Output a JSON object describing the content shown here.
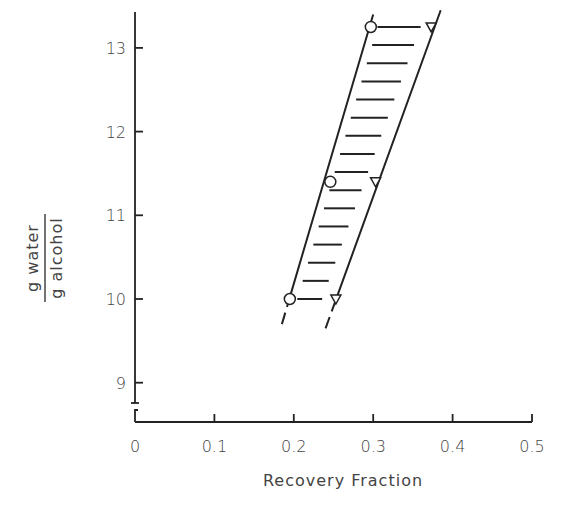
{
  "chart_data": {
    "type": "scatter",
    "title": "",
    "xlabel": "Recovery Fraction",
    "ylabel": {
      "numerator": "g water",
      "denominator": "g alcohol"
    },
    "xlim": [
      0,
      0.5
    ],
    "ylim": [
      8.7,
      13.4
    ],
    "x_ticks": [
      "0",
      "0.1",
      "0.2",
      "0.3",
      "0.4",
      "0.5"
    ],
    "y_ticks": [
      "9",
      "10",
      "11",
      "12",
      "13"
    ],
    "y_axis_break": true,
    "grid": false,
    "legend": null,
    "series": [
      {
        "name": "circle",
        "marker": "open-circle",
        "points": [
          {
            "x": 0.195,
            "y": 10.0
          },
          {
            "x": 0.246,
            "y": 11.4
          },
          {
            "x": 0.297,
            "y": 13.25
          }
        ]
      },
      {
        "name": "triangle",
        "marker": "open-triangle-down",
        "points": [
          {
            "x": 0.253,
            "y": 10.0
          },
          {
            "x": 0.303,
            "y": 11.4
          },
          {
            "x": 0.373,
            "y": 13.25
          }
        ]
      }
    ],
    "band": {
      "description": "hatched region bounded by two sloped boundary lines between circle and triangle series",
      "left_boundary": [
        {
          "x": 0.185,
          "y": 9.7
        },
        {
          "x": 0.3,
          "y": 13.4
        }
      ],
      "right_boundary": [
        {
          "x": 0.24,
          "y": 9.65
        },
        {
          "x": 0.385,
          "y": 13.45
        }
      ],
      "hatch_count": 16
    }
  },
  "axes": {
    "x_tick_labels": [
      "0",
      "0.1",
      "0.2",
      "0.3",
      "0.4",
      "0.5"
    ],
    "y_tick_labels": [
      "9",
      "10",
      "11",
      "12",
      "13"
    ],
    "x_title": "Recovery Fraction",
    "y_title_numerator": "g water",
    "y_title_denominator": "g alcohol"
  }
}
